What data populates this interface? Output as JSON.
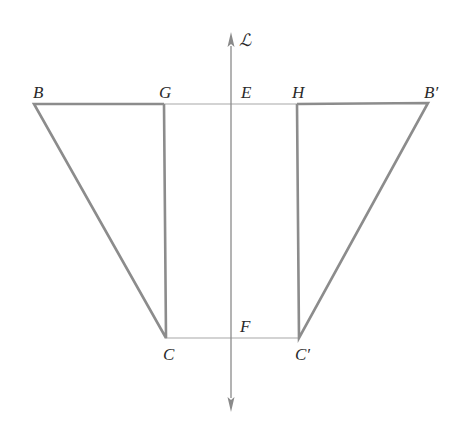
{
  "diagram": {
    "type": "geometric-reflection",
    "axis": {
      "label": "ℒ",
      "x": 231,
      "y_top": 32,
      "y_bottom": 412,
      "color": "#8a8a8a"
    },
    "points": {
      "B": {
        "label": "B",
        "x": 34,
        "y": 104
      },
      "G": {
        "label": "G",
        "x": 164,
        "y": 104
      },
      "E": {
        "label": "E",
        "x": 231,
        "y": 104
      },
      "H": {
        "label": "H",
        "x": 297,
        "y": 104
      },
      "B_prime": {
        "label": "B′",
        "x": 428,
        "y": 103
      },
      "C": {
        "label": "C",
        "x": 166,
        "y": 338
      },
      "F": {
        "label": "F",
        "x": 231,
        "y": 338
      },
      "C_prime": {
        "label": "C′",
        "x": 299,
        "y": 338
      }
    },
    "segments": [
      {
        "from": "B",
        "to": "G",
        "weight": "bold"
      },
      {
        "from": "G",
        "to": "H",
        "weight": "thin"
      },
      {
        "from": "H",
        "to": "B_prime",
        "weight": "bold"
      },
      {
        "from": "B",
        "to": "C",
        "weight": "bold"
      },
      {
        "from": "G",
        "to": "C",
        "weight": "bold"
      },
      {
        "from": "B_prime",
        "to": "C_prime",
        "weight": "bold"
      },
      {
        "from": "H",
        "to": "C_prime",
        "weight": "bold"
      },
      {
        "from": "C",
        "to": "C_prime",
        "weight": "thin"
      }
    ],
    "colors": {
      "bold_line": "#8c8c8c",
      "thin_line": "#a0a0a0",
      "label": "#2a2a2a"
    }
  }
}
